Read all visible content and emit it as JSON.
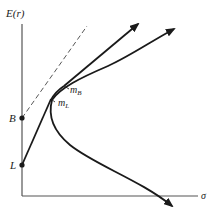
{
  "diagram": {
    "y_axis_label": "E(r)",
    "x_axis_label": "σ",
    "points": {
      "B": {
        "label": "B"
      },
      "L": {
        "label": "L"
      }
    },
    "portfolios": {
      "mB": {
        "base": "m",
        "sub": "B"
      },
      "mL": {
        "base": "m",
        "sub": "L"
      }
    },
    "colors": {
      "line": "#1a1a1a",
      "axis": "#555555",
      "dashed": "#444444"
    }
  }
}
